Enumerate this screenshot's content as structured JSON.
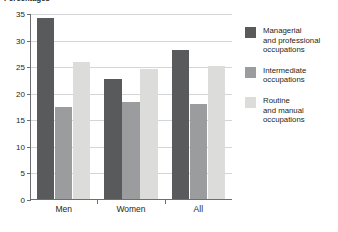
{
  "chart_data": {
    "type": "bar",
    "title": "Percentages",
    "xlabel": "",
    "ylabel": "",
    "categories": [
      "Men",
      "Women",
      "All"
    ],
    "series": [
      {
        "name": "Managerial\nand professional\noccupations",
        "color": "#595a5c",
        "values": [
          34.0,
          22.5,
          28.0
        ]
      },
      {
        "name": "Intermediate\noccupations",
        "color": "#9b9c9e",
        "values": [
          17.3,
          18.2,
          17.8
        ]
      },
      {
        "name": "Routine\nand manual\noccupations",
        "color": "#dcdddb",
        "values": [
          25.8,
          24.5,
          25.0
        ]
      }
    ],
    "ylim": [
      0,
      35
    ],
    "yticks": [
      0,
      5,
      10,
      15,
      20,
      25,
      30,
      35
    ],
    "ytick_labels": [
      "0",
      "5",
      "10",
      "15",
      "20",
      "25",
      "30",
      "35"
    ],
    "grid": true,
    "legend_position": "right"
  }
}
